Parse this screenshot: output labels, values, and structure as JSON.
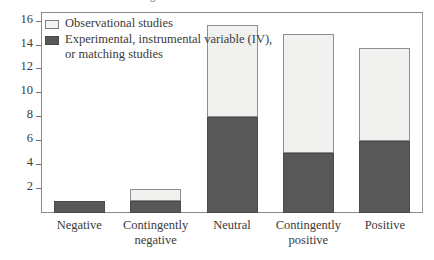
{
  "caption": {
    "sliver_text": "g"
  },
  "legend": {
    "position": "top-left-inside",
    "entries": [
      {
        "label": "Observational studies",
        "swatch": "light",
        "color": "#f1f1ef"
      },
      {
        "label": "Experimental, instrumental variable (IV), or matching studies",
        "swatch": "dark",
        "color": "#585858"
      }
    ]
  },
  "axes": {
    "y_ticks": [
      "2",
      "4",
      "6",
      "8",
      "10",
      "12",
      "14",
      "16"
    ],
    "x_labels": [
      "Negative",
      "Contingently negative",
      "Neutral",
      "Contingently positive",
      "Positive"
    ]
  },
  "chart_data": {
    "type": "bar",
    "stacked": true,
    "title": "",
    "xlabel": "",
    "ylabel": "",
    "ylim": [
      0,
      16.8
    ],
    "ytick_step": 2,
    "grid": false,
    "legend_position": "upper left (inside plot)",
    "categories": [
      "Negative",
      "Contingently negative",
      "Neutral",
      "Contingently positive",
      "Positive"
    ],
    "series": [
      {
        "name": "Experimental, instrumental variable (IV), or matching studies",
        "color": "#585858",
        "values": [
          1,
          1,
          8,
          5,
          6
        ]
      },
      {
        "name": "Observational studies",
        "color": "#f1f1ef",
        "values": [
          0,
          1,
          7.7,
          10,
          7.8
        ]
      }
    ],
    "totals": [
      1,
      2,
      15.7,
      15,
      13.8
    ]
  }
}
